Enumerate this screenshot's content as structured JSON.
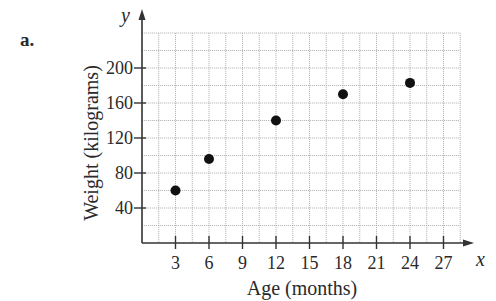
{
  "figure": {
    "panel_label": "a.",
    "background": "#ffffff",
    "point_color": "#111111",
    "grid_color": "#a8a8a8",
    "axis_color": "#333333"
  },
  "chart_data": {
    "type": "scatter",
    "title": "",
    "panel_label": "a.",
    "xlabel": "Age (months)",
    "ylabel": "Weight (kilograms)",
    "x_axis_symbol": "x",
    "y_axis_symbol": "y",
    "x": [
      3,
      6,
      12,
      18,
      24
    ],
    "y": [
      60,
      96,
      140,
      170,
      183
    ],
    "points": [
      {
        "x": 3,
        "y": 60
      },
      {
        "x": 6,
        "y": 96
      },
      {
        "x": 12,
        "y": 140
      },
      {
        "x": 18,
        "y": 170
      },
      {
        "x": 24,
        "y": 183
      }
    ],
    "xticks": [
      3,
      6,
      9,
      12,
      15,
      18,
      21,
      24,
      27
    ],
    "yticks": [
      40,
      80,
      120,
      160,
      200
    ],
    "xlim": [
      0,
      28.5
    ],
    "ylim": [
      0,
      240
    ],
    "grid": true,
    "grid_x_step": 1.5,
    "grid_y_step": 20,
    "legend": null
  }
}
